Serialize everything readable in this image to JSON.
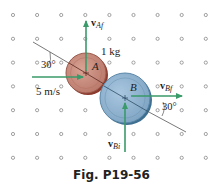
{
  "figure": {
    "caption": "Fig. P19-56",
    "grid": {
      "rows": 7,
      "cols": 9,
      "x0": 13,
      "y0": 15,
      "dx": 24.1,
      "dy": 23.8,
      "dot_color": "#8a8a8a"
    },
    "disc_a": {
      "label": "A",
      "mass_label": "1 kg",
      "cx": 86,
      "cy": 73,
      "r": 20,
      "fill": "#c98f80",
      "rim": "#8c3a2e"
    },
    "disc_b": {
      "label": "B",
      "cx": 125,
      "cy": 98,
      "r": 25,
      "fill": "#8fb3d1",
      "rim": "#3f6f90"
    },
    "vectors": {
      "v_ai": {
        "label": "5 m/s",
        "color": "#3a9a6a"
      },
      "v_af": {
        "label_main": "v",
        "label_sub": "Af",
        "color": "#3a9a6a"
      },
      "v_bf": {
        "label_main": "v",
        "label_sub": "Bf",
        "color": "#3a9a6a"
      },
      "v_bi": {
        "label_main": "v",
        "label_sub": "Bi",
        "color": "#3a9a6a"
      }
    },
    "angles": {
      "angle_a": "30°",
      "angle_b": "30°"
    }
  }
}
